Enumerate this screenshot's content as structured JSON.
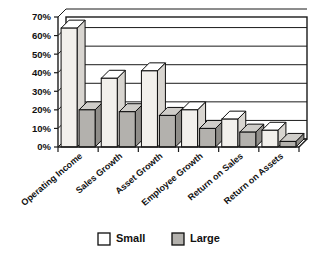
{
  "chart_data": {
    "type": "bar",
    "title": "",
    "subtitle": "",
    "xlabel": "",
    "ylabel": "",
    "ylim": [
      0,
      70
    ],
    "ytick_values": [
      0,
      10,
      20,
      30,
      40,
      50,
      60,
      70
    ],
    "ytick_labels": [
      "0%",
      "10%",
      "20%",
      "30%",
      "40%",
      "50%",
      "60%",
      "70%"
    ],
    "grid": true,
    "grid_axis": "y",
    "legend_position": "bottom",
    "style_3d": true,
    "categories": [
      "Operating Income",
      "Sales Growth",
      "Asset Growth",
      "Employee Growth",
      "Return on Sales",
      "Return on Assets"
    ],
    "series": [
      {
        "name": "Small",
        "color": "#f2f0ec",
        "values": [
          64,
          37,
          41,
          20,
          15,
          9
        ]
      },
      {
        "name": "Large",
        "color": "#b3b1ad",
        "values": [
          20,
          19,
          17,
          10,
          8,
          3
        ]
      }
    ],
    "value_unit": "%"
  },
  "legend": {
    "items": [
      {
        "label": "Small",
        "color": "#ffffff"
      },
      {
        "label": "Large",
        "color": "#b3b1ad"
      }
    ]
  },
  "axis": {
    "y_labels": [
      "70%",
      "60%",
      "50%",
      "40%",
      "30%",
      "20%",
      "10%",
      "0%"
    ]
  },
  "colors": {
    "small_front": "#f2f0ec",
    "small_top": "#ffffff",
    "small_side": "#d8d5d0",
    "large_front": "#b3b1ad",
    "large_top": "#cfcdc9",
    "large_side": "#8f8d89",
    "outline": "#0d0d0d",
    "grid": "#1a1a1a",
    "background": "#ffffff"
  }
}
